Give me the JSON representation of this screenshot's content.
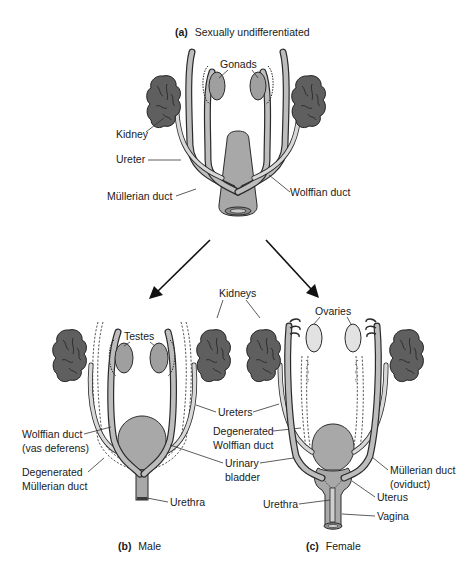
{
  "figure": {
    "panels": [
      {
        "id": "a",
        "letter": "(a)",
        "title": "Sexually undifferentiated",
        "labels": {
          "gonads": "Gonads",
          "kidney": "Kidney",
          "ureter": "Ureter",
          "mullerian_duct": "Müllerian duct",
          "wolffian_duct": "Wolffian duct"
        }
      },
      {
        "id": "b",
        "letter": "(b)",
        "title": "Male",
        "labels": {
          "testes": "Testes",
          "wolffian_duct_line1": "Wolffian duct",
          "wolffian_duct_line2": "(vas deferens)",
          "degenerated_mullerian_line1": "Degenerated",
          "degenerated_mullerian_line2": "Müllerian duct",
          "urethra": "Urethra"
        }
      },
      {
        "id": "c",
        "letter": "(c)",
        "title": "Female",
        "labels": {
          "ovaries": "Ovaries",
          "mullerian_duct_line1": "Müllerian duct",
          "mullerian_duct_line2": "(oviduct)",
          "uterus": "Uterus",
          "urethra": "Urethra",
          "vagina": "Vagina"
        }
      }
    ],
    "shared_labels": {
      "kidneys": "Kidneys",
      "ureters": "Ureters",
      "degenerated_wolffian_line1": "Degenerated",
      "degenerated_wolffian_line2": "Wolffian duct",
      "urinary_bladder_line1": "Urinary",
      "urinary_bladder_line2": "bladder"
    },
    "arrows": [
      {
        "from": "a",
        "to": "b",
        "direction": "down-left"
      },
      {
        "from": "a",
        "to": "c",
        "direction": "down-right"
      }
    ],
    "colors": {
      "kidney": "#5f5f5f",
      "gonad": "#9f9f9f",
      "ovary": "#e2e2e2",
      "duct": "#bdbdbd",
      "outline": "#2a2a2a"
    }
  }
}
